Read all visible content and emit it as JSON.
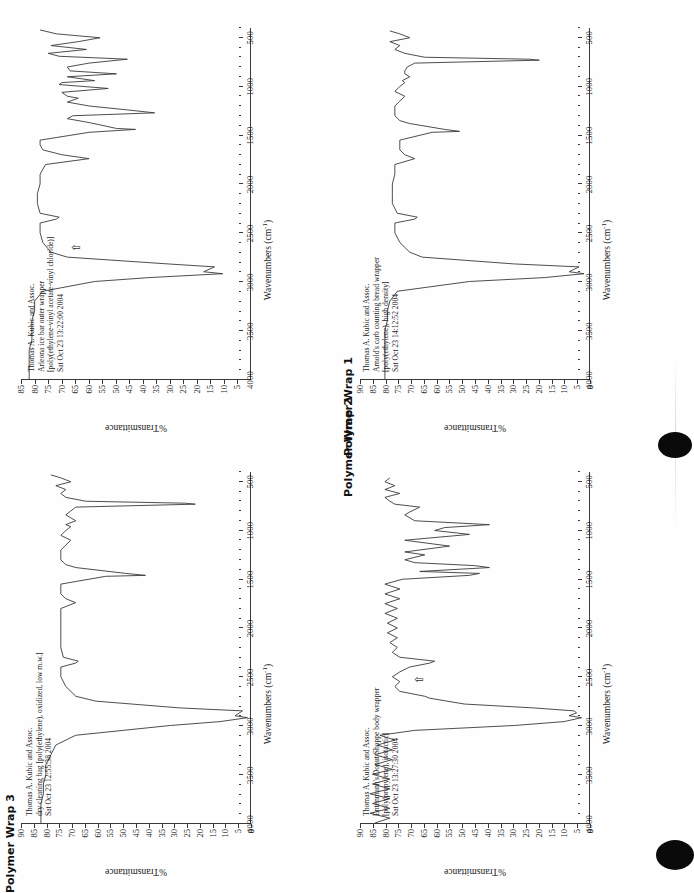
{
  "page": {
    "background": "#fefefe",
    "ink": "#1b1b1b",
    "trace_color": "#3a3a3a"
  },
  "axes": {
    "x_title": "Wavenumbers (cm",
    "x_title_sup": "-1",
    "x_title_close": ")",
    "y_title": "%Transmittance",
    "x_ticks": [
      4000,
      3500,
      3000,
      2500,
      2000,
      1500,
      1000,
      500
    ],
    "x_min": 4000,
    "x_max": 400,
    "y_ticks_full": [
      90,
      85,
      80,
      75,
      70,
      65,
      60,
      55,
      50,
      45,
      40,
      35,
      30,
      25,
      20,
      15,
      10,
      5,
      0
    ],
    "y_ticks_85": [
      85,
      80,
      75,
      70,
      65,
      60,
      55,
      50,
      45,
      40,
      35,
      30,
      25,
      20,
      15,
      10,
      5
    ]
  },
  "captions": {
    "wrap1": "Polymer Wrap 1",
    "wrap2": "Polymer Wrap 2",
    "wrap3": "Polymer Wrap 3"
  },
  "panels": {
    "top_left": {
      "id": "spectrum-arleona-ice-bar",
      "annotation": [
        "Thomas A. Kubic and Assoc.",
        "Arleona ice bar outer wrapper",
        "[poly(ethylene-vinyl acetate-vinyl chloride)]",
        "Sat Oct 23 13:22:00 2004"
      ],
      "cursor_marker": "⇧"
    },
    "top_right": {
      "id": "spectrum-arnolds-bread-wrapper",
      "annotation": [
        "Thomas A. Kubic and Assoc.",
        "Arnold's carb counting bread wrapper",
        "[poly(ethylene), high density]",
        "Sat Oct 23 14:12:52 2004"
      ],
      "cursor_marker": ""
    },
    "bottom_left": {
      "id": "spectrum-dry-cleaning-bag",
      "annotation": [
        "Thomas A. Kubic and Assoc.",
        "dry cleaning bag [poly(ethylene), oxidized, low m.w.]",
        "Sat Oct 23 12:55:38 2004"
      ],
      "cursor_marker": ""
    },
    "bottom_right": {
      "id": "spectrum-entenmanns-donut-wrapper",
      "annotation": [
        "Thomas A. Kubic and Assoc.",
        "Entenmann's Donut Shoppe body wrapper",
        "[poly(propylene), isotactic]",
        "Sat Oct 23 13:27:30 2004"
      ],
      "cursor_marker": "⇧"
    }
  },
  "chart_data": [
    {
      "id": "spectrum-arleona-ice-bar",
      "type": "line",
      "title": "Arleona ice bar outer wrapper",
      "subtitle": "[poly(ethylene-vinyl acetate-vinyl chloride)]",
      "xlabel": "Wavenumbers (cm-1)",
      "ylabel": "%Transmittance",
      "xlim": [
        4000,
        400
      ],
      "ylim": [
        3,
        87
      ],
      "grid": false,
      "legend": "none",
      "x": [
        4000,
        3900,
        3800,
        3700,
        3600,
        3500,
        3400,
        3300,
        3200,
        3100,
        3000,
        2960,
        2920,
        2900,
        2850,
        2820,
        2750,
        2700,
        2600,
        2500,
        2400,
        2360,
        2340,
        2300,
        2200,
        2100,
        2000,
        1900,
        1800,
        1740,
        1700,
        1650,
        1600,
        1550,
        1470,
        1440,
        1430,
        1370,
        1330,
        1300,
        1270,
        1240,
        1200,
        1160,
        1120,
        1100,
        1060,
        1020,
        980,
        960,
        940,
        900,
        870,
        840,
        800,
        760,
        720,
        690,
        660,
        620,
        580,
        540,
        500,
        460,
        420
      ],
      "y": [
        84,
        84,
        84,
        84,
        83,
        83,
        83,
        82,
        82,
        79,
        60,
        40,
        13,
        20,
        16,
        33,
        70,
        76,
        79,
        80,
        80,
        74,
        73,
        80,
        81,
        81,
        80,
        80,
        78,
        62,
        72,
        79,
        80,
        80,
        62,
        45,
        52,
        62,
        70,
        68,
        38,
        48,
        62,
        70,
        66,
        70,
        72,
        55,
        73,
        72,
        60,
        70,
        52,
        69,
        70,
        62,
        48,
        73,
        77,
        63,
        76,
        66,
        58,
        74,
        80
      ]
    },
    {
      "id": "spectrum-arnolds-bread-wrapper",
      "type": "line",
      "title": "Arnold's carb counting bread wrapper",
      "subtitle": "[poly(ethylene), high density]",
      "xlabel": "Wavenumbers (cm-1)",
      "ylabel": "%Transmittance",
      "xlim": [
        4000,
        400
      ],
      "ylim": [
        0,
        92
      ],
      "grid": false,
      "legend": "none",
      "x": [
        4000,
        3900,
        3800,
        3700,
        3600,
        3500,
        3400,
        3300,
        3200,
        3100,
        3000,
        2960,
        2920,
        2900,
        2850,
        2820,
        2750,
        2700,
        2600,
        2500,
        2400,
        2360,
        2340,
        2300,
        2200,
        2100,
        2000,
        1900,
        1800,
        1740,
        1700,
        1650,
        1600,
        1550,
        1470,
        1460,
        1440,
        1380,
        1350,
        1300,
        1250,
        1200,
        1150,
        1100,
        1050,
        1000,
        960,
        940,
        900,
        870,
        840,
        800,
        760,
        730,
        720,
        700,
        660,
        620,
        580,
        540,
        500,
        460,
        430
      ],
      "y": [
        82,
        82,
        82,
        82,
        82,
        82,
        81,
        81,
        80,
        77,
        48,
        18,
        2,
        8,
        4,
        30,
        67,
        72,
        76,
        78,
        78,
        70,
        69,
        77,
        79,
        79,
        79,
        78,
        78,
        70,
        74,
        76,
        76,
        76,
        63,
        52,
        58,
        72,
        76,
        78,
        78,
        78,
        76,
        74,
        78,
        76,
        74,
        75,
        72,
        74,
        74,
        73,
        70,
        20,
        24,
        66,
        74,
        78,
        76,
        80,
        72,
        76,
        80
      ]
    },
    {
      "id": "spectrum-dry-cleaning-bag",
      "type": "line",
      "title": "dry cleaning bag [poly(ethylene), oxidized, low m.w.]",
      "subtitle": "",
      "xlabel": "Wavenumbers (cm-1)",
      "ylabel": "%Transmittance",
      "xlim": [
        4000,
        400
      ],
      "ylim": [
        0,
        92
      ],
      "grid": false,
      "legend": "none",
      "x": [
        4000,
        3900,
        3800,
        3700,
        3600,
        3500,
        3400,
        3300,
        3200,
        3100,
        3000,
        2960,
        2920,
        2900,
        2850,
        2820,
        2750,
        2700,
        2600,
        2500,
        2400,
        2360,
        2340,
        2300,
        2200,
        2100,
        2000,
        1900,
        1800,
        1740,
        1700,
        1650,
        1600,
        1550,
        1470,
        1460,
        1440,
        1380,
        1350,
        1300,
        1250,
        1200,
        1150,
        1100,
        1050,
        1000,
        960,
        940,
        900,
        870,
        840,
        800,
        760,
        730,
        720,
        700,
        660,
        620,
        580,
        540,
        500,
        460,
        430
      ],
      "y": [
        84,
        84,
        84,
        83,
        83,
        82,
        82,
        80,
        78,
        70,
        32,
        12,
        1,
        6,
        3,
        28,
        62,
        70,
        74,
        76,
        76,
        70,
        69,
        75,
        76,
        76,
        76,
        76,
        76,
        70,
        74,
        76,
        76,
        76,
        58,
        42,
        50,
        70,
        74,
        76,
        76,
        76,
        74,
        72,
        76,
        74,
        72,
        74,
        70,
        72,
        74,
        72,
        70,
        22,
        26,
        66,
        74,
        76,
        74,
        78,
        72,
        76,
        80
      ]
    },
    {
      "id": "spectrum-entenmanns-donut-wrapper",
      "type": "line",
      "title": "Entenmann's Donut Shoppe body wrapper",
      "subtitle": "[poly(propylene), isotactic]",
      "xlabel": "Wavenumbers (cm-1)",
      "ylabel": "%Transmittance",
      "xlim": [
        4000,
        400
      ],
      "ylim": [
        0,
        92
      ],
      "grid": false,
      "legend": "none",
      "x": [
        4000,
        3950,
        3900,
        3850,
        3800,
        3750,
        3700,
        3650,
        3600,
        3550,
        3500,
        3450,
        3400,
        3350,
        3300,
        3250,
        3200,
        3150,
        3100,
        3050,
        3000,
        2960,
        2920,
        2900,
        2870,
        2850,
        2820,
        2780,
        2720,
        2700,
        2650,
        2600,
        2550,
        2500,
        2450,
        2400,
        2360,
        2340,
        2300,
        2250,
        2200,
        2150,
        2100,
        2050,
        2000,
        1950,
        1900,
        1850,
        1800,
        1750,
        1700,
        1650,
        1600,
        1550,
        1500,
        1460,
        1440,
        1420,
        1380,
        1360,
        1330,
        1300,
        1250,
        1220,
        1160,
        1100,
        1040,
        1000,
        970,
        940,
        900,
        840,
        810,
        760,
        730,
        700,
        660,
        620,
        580,
        540,
        500,
        460,
        420
      ],
      "y": [
        86,
        80,
        88,
        80,
        87,
        80,
        88,
        80,
        87,
        80,
        87,
        79,
        86,
        79,
        86,
        79,
        85,
        78,
        84,
        70,
        30,
        10,
        3,
        8,
        5,
        6,
        22,
        50,
        64,
        66,
        76,
        78,
        76,
        79,
        76,
        72,
        64,
        62,
        76,
        79,
        77,
        80,
        77,
        81,
        77,
        81,
        77,
        82,
        77,
        82,
        76,
        82,
        76,
        82,
        75,
        48,
        44,
        68,
        40,
        46,
        70,
        74,
        66,
        74,
        56,
        74,
        48,
        62,
        58,
        40,
        70,
        74,
        72,
        68,
        78,
        80,
        82,
        76,
        82,
        78,
        82,
        80
      ]
    }
  ]
}
